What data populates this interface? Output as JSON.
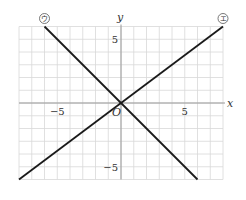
{
  "chart_data": {
    "type": "line",
    "title": "",
    "xlabel": "x",
    "ylabel": "y",
    "origin_label": "O",
    "xlim": [
      -8,
      8
    ],
    "ylim": [
      -6,
      6
    ],
    "grid": true,
    "grid_step": 1,
    "x_ticks": [
      {
        "value": -5,
        "label": "−5"
      },
      {
        "value": 5,
        "label": "5"
      }
    ],
    "y_ticks": [
      {
        "value": 5,
        "label": "5"
      },
      {
        "value": -5,
        "label": "−5"
      }
    ],
    "series": [
      {
        "name": "ウ",
        "marker_label": "ウ",
        "equation": "y = -x",
        "points": [
          [
            -6,
            6
          ],
          [
            6,
            -6
          ]
        ],
        "label_at": [
          -6,
          6
        ]
      },
      {
        "name": "エ",
        "marker_label": "エ",
        "equation": "y = 3/4 x",
        "points": [
          [
            -8,
            -6
          ],
          [
            8,
            6
          ]
        ],
        "label_at": [
          8,
          6
        ]
      }
    ],
    "legend": "none (circled labels at line ends)"
  },
  "style": {
    "grid_color": "#d8d8d8",
    "axis_color": "#9a9a9a",
    "line_color": "#1a1a1a"
  }
}
